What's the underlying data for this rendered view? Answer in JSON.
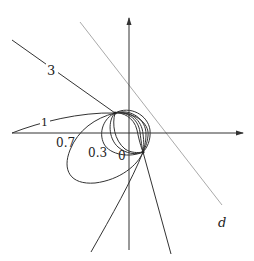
{
  "figure": {
    "colors": {
      "curve": "#333333",
      "axis": "#333333",
      "line_d": "#aaaaaa",
      "background": "#ffffff"
    },
    "axes": {
      "horizontal": {
        "x1": 12,
        "y": 133,
        "x2": 243
      },
      "vertical": {
        "x": 129,
        "y1": 250,
        "y2": 18
      }
    },
    "points": {
      "A": {
        "x": 115,
        "y": 113
      },
      "B": {
        "x": 143,
        "y": 152
      }
    },
    "line_d": {
      "label": "d",
      "x1": 80,
      "y1": 22,
      "x2": 222,
      "y2": 205,
      "label_x": 219,
      "label_y": 226
    },
    "curve_labels": [
      {
        "id": "3",
        "text": "3",
        "x": 52,
        "y": 73
      },
      {
        "id": "1",
        "text": "1",
        "x": 44,
        "y": 125
      },
      {
        "id": "0.7",
        "text": "0.7",
        "x": 56,
        "y": 147
      },
      {
        "id": "0.3",
        "text": "0.3",
        "x": 88,
        "y": 155
      },
      {
        "id": "0",
        "text": "0",
        "x": 119,
        "y": 159
      }
    ]
  }
}
